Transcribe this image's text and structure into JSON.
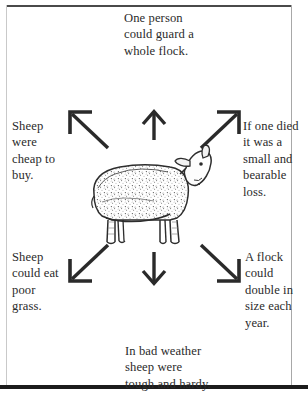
{
  "diagram": {
    "title_text": "Advantages of keeping sheep",
    "center_figure": {
      "name": "sheep-illustration",
      "description": "line drawing of a woolly sheep facing right"
    },
    "callouts": [
      {
        "id": "top",
        "position": "top-center",
        "text": "One person\ncould guard a\nwhole flock.",
        "arrow": "arrow-up"
      },
      {
        "id": "left-top",
        "position": "left-upper",
        "text": "Sheep\nwere\ncheap to\nbuy.",
        "arrow": "arrow-up-left"
      },
      {
        "id": "right-top",
        "position": "right-upper",
        "text": "If one died\nit was a\nsmall and\nbearable\nloss.",
        "arrow": "arrow-up-right"
      },
      {
        "id": "left-bottom",
        "position": "left-lower",
        "text": "Sheep\ncould eat\npoor\ngrass.",
        "arrow": "arrow-down-left"
      },
      {
        "id": "right-bottom",
        "position": "right-lower",
        "text": "A flock\ncould\ndouble in\nsize each\nyear.",
        "arrow": "arrow-down-right"
      },
      {
        "id": "bottom",
        "position": "bottom-center",
        "text": "In bad weather\nsheep were\ntough and hardy.",
        "arrow": "arrow-down"
      }
    ],
    "colors": {
      "ink": "#2b2b2b",
      "arrow": "#2a2a2a",
      "frame": "#1c1c1c",
      "background": "#ffffff"
    }
  }
}
